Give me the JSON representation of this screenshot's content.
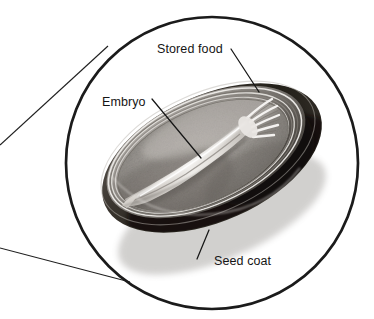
{
  "figure": {
    "type": "biology-diagram",
    "background_color": "#ffffff",
    "ink_color": "#151515"
  },
  "magnifier": {
    "name": "magnifier-circle",
    "center_x": 212,
    "center_y": 163,
    "radius": 146,
    "stroke_color": "#1b1b1b",
    "stroke_width": 2.6,
    "tangent_lines": [
      {
        "name": "upper-tangent",
        "x1": 0,
        "y1": 145,
        "x2": 106,
        "y2": 47
      },
      {
        "name": "lower-tangent",
        "x1": 0,
        "y1": 248,
        "x2": 128,
        "y2": 281
      }
    ]
  },
  "labels": [
    {
      "id": "stored-food",
      "text": "Stored food",
      "x": 157,
      "y": 43,
      "leader": {
        "x1": 231,
        "y1": 49,
        "x2": 259,
        "y2": 92
      }
    },
    {
      "id": "embryo",
      "text": "Embryo",
      "x": 102,
      "y": 96,
      "leader": {
        "x1": 152,
        "y1": 99,
        "x2": 201,
        "y2": 158
      }
    },
    {
      "id": "seed-coat",
      "text": "Seed coat",
      "x": 214,
      "y": 255,
      "leader": {
        "x1": 209,
        "y1": 230,
        "x2": 197,
        "y2": 259
      }
    }
  ],
  "seed_parts": [
    {
      "id": "seed-coat-rim",
      "name": "Seed coat",
      "shade": "#2a2724",
      "role": "outer dark protective layer"
    },
    {
      "id": "stored-food",
      "name": "Stored food",
      "shade": "#9a9793",
      "role": "endosperm / cotyledon food store"
    },
    {
      "id": "embryo",
      "name": "Embryo",
      "shade": "#dedad5",
      "role": "young plant with plumule tip"
    },
    {
      "id": "coat-layers",
      "name": "Seed coat layers",
      "shade": "#bfbbb6",
      "role": "concentric cut edge rings"
    }
  ],
  "colors": {
    "ink": "#151515",
    "circle_stroke": "#1b1b1b",
    "coat_dark": "#2a2724",
    "coat_mid": "#4a4540",
    "food_light": "#b8b4af",
    "food_mid": "#8f8b86",
    "food_dark": "#6d6964",
    "embryo_light": "#eceae7",
    "embryo_mid": "#c9c5c0",
    "paper": "#ffffff"
  }
}
